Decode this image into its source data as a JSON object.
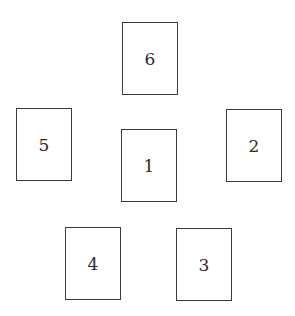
{
  "diagram": {
    "type": "card-layout",
    "cards": [
      {
        "position": "center",
        "label": "1",
        "x": 121,
        "y": 129
      },
      {
        "position": "right",
        "label": "2",
        "x": 226,
        "y": 109
      },
      {
        "position": "bottom-right",
        "label": "3",
        "x": 176,
        "y": 228
      },
      {
        "position": "bottom-left",
        "label": "4",
        "x": 65,
        "y": 227
      },
      {
        "position": "left",
        "label": "5",
        "x": 16,
        "y": 108
      },
      {
        "position": "top",
        "label": "6",
        "x": 122,
        "y": 22
      }
    ]
  },
  "colors": {
    "border": "#3a3a3a",
    "background": "#ffffff",
    "text": "#2a2a2a"
  }
}
